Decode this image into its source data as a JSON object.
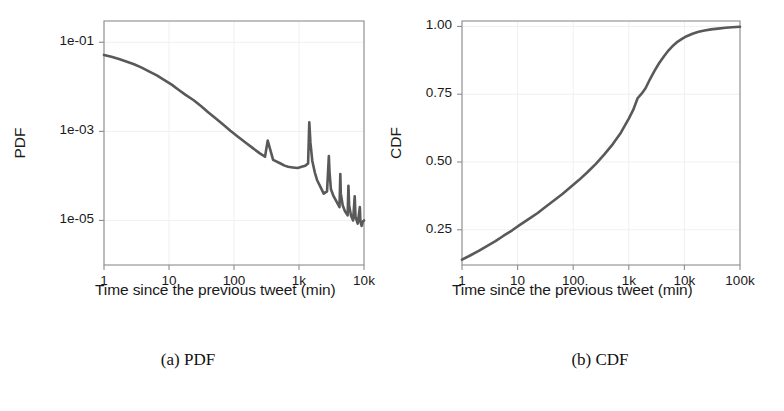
{
  "figure": {
    "background_color": "#ffffff",
    "curve_color": "#595959",
    "axis_color": "#8c8c8c",
    "grid_color": "#f0f0f0",
    "text_color": "#1a1a1a"
  },
  "captions": {
    "left": "(a) PDF",
    "right": "(b) CDF"
  },
  "chart_data": [
    {
      "type": "line",
      "id": "pdf-plot",
      "title": "",
      "xlabel": "Time since the previous tweet (min)",
      "ylabel": "PDF",
      "xscale": "log",
      "yscale": "log",
      "xlim": [
        1,
        10000
      ],
      "ylim": [
        1e-06,
        0.3
      ],
      "grid": true,
      "legend": "none",
      "xticks": [
        1,
        10,
        100,
        1000,
        10000
      ],
      "xticklabels": [
        "1",
        "10",
        "100",
        "1k",
        "10k"
      ],
      "yticks": [
        0.1,
        0.001,
        1e-05
      ],
      "yticklabels": [
        "1e-01",
        "1e-03",
        "1e-05"
      ],
      "annotations": [
        "power-law decay with periodic spikes at daily harmonics",
        "large spike near 1440 min (1 day)"
      ],
      "x": [
        1,
        1.3,
        1.7,
        2.2,
        2.9,
        3.8,
        5,
        6.5,
        8.5,
        11,
        14,
        18,
        24,
        31,
        40,
        52,
        68,
        88,
        115,
        150,
        195,
        250,
        300,
        330,
        400,
        520,
        600,
        680,
        800,
        950,
        1100,
        1250,
        1380,
        1440,
        1500,
        1600,
        1750,
        1900,
        2100,
        2400,
        2700,
        2880,
        2950,
        3100,
        3400,
        3800,
        4200,
        4320,
        4400,
        4700,
        5100,
        5600,
        5760,
        5900,
        6300,
        6800,
        7200,
        7400,
        8000,
        8640,
        8800,
        9200,
        9600,
        10000
      ],
      "y": [
        0.052,
        0.047,
        0.042,
        0.037,
        0.032,
        0.027,
        0.022,
        0.018,
        0.0142,
        0.0112,
        0.0086,
        0.0066,
        0.005,
        0.0037,
        0.0027,
        0.00196,
        0.00142,
        0.00103,
        0.00076,
        0.00056,
        0.00042,
        0.00032,
        0.00027,
        0.00062,
        0.00023,
        0.00019,
        0.00017,
        0.00016,
        0.000155,
        0.00015,
        0.00016,
        0.00017,
        0.00019,
        0.0016,
        0.00055,
        0.00022,
        0.00012,
        8e-05,
        6e-05,
        4e-05,
        4.5e-05,
        0.00028,
        0.00012,
        5e-05,
        3.5e-05,
        2.6e-05,
        2e-05,
        0.00011,
        4e-05,
        2.2e-05,
        1.6e-05,
        1.3e-05,
        6e-05,
        2.2e-05,
        1.3e-05,
        1e-05,
        3.5e-05,
        1.2e-05,
        8.5e-06,
        2e-05,
        9.5e-06,
        7.5e-06,
        9.5e-06,
        1e-05
      ]
    },
    {
      "type": "line",
      "id": "cdf-plot",
      "title": "",
      "xlabel": "Time since the previous tweet (min)",
      "ylabel": "CDF",
      "xscale": "log",
      "yscale": "linear",
      "xlim": [
        1,
        100000
      ],
      "ylim": [
        0.12,
        1.02
      ],
      "grid": true,
      "legend": "none",
      "xticks": [
        1,
        10,
        100,
        1000,
        10000,
        100000
      ],
      "xticklabels": [
        "1",
        "10",
        "100",
        "1k",
        "10k",
        "100k"
      ],
      "yticks": [
        0.25,
        0.5,
        0.75,
        1.0
      ],
      "yticklabels": [
        "0.25",
        "0.50",
        "0.75",
        "1.00"
      ],
      "annotations": [
        "inflection knee near 1k-2k min (one day)",
        "saturates toward 1.00 beyond 10k min"
      ],
      "x": [
        1,
        1.4,
        2,
        2.8,
        4,
        5.6,
        8,
        11,
        16,
        23,
        32,
        45,
        64,
        90,
        128,
        180,
        256,
        360,
        512,
        720,
        1000,
        1200,
        1440,
        1700,
        2000,
        2400,
        2900,
        3500,
        4300,
        5200,
        6300,
        7600,
        9200,
        11000,
        14000,
        18000,
        23000,
        30000,
        40000,
        55000,
        72000,
        100000
      ],
      "y": [
        0.14,
        0.155,
        0.172,
        0.19,
        0.208,
        0.228,
        0.248,
        0.268,
        0.29,
        0.312,
        0.335,
        0.358,
        0.382,
        0.408,
        0.434,
        0.462,
        0.493,
        0.527,
        0.565,
        0.608,
        0.66,
        0.692,
        0.735,
        0.752,
        0.772,
        0.805,
        0.836,
        0.864,
        0.89,
        0.912,
        0.93,
        0.944,
        0.955,
        0.964,
        0.973,
        0.98,
        0.985,
        0.989,
        0.992,
        0.995,
        0.997,
        0.999
      ]
    }
  ]
}
